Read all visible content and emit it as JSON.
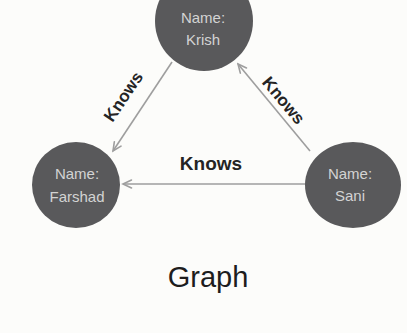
{
  "diagram": {
    "title": "Graph",
    "nodes": [
      {
        "id": "krish",
        "label_line1": "Name:",
        "label_line2": "Krish"
      },
      {
        "id": "farshad",
        "label_line1": "Name:",
        "label_line2": "Farshad"
      },
      {
        "id": "sani",
        "label_line1": "Name:",
        "label_line2": "Sani"
      }
    ],
    "edges": [
      {
        "from": "Krish",
        "to": "Farshad",
        "label": "Knows"
      },
      {
        "from": "Sani",
        "to": "Krish",
        "label": "Knows"
      },
      {
        "from": "Sani",
        "to": "Farshad",
        "label": "Knows"
      }
    ],
    "colors": {
      "background": "#fcfcfa",
      "node_fill": "#59595b",
      "node_text": "#d3d3d3",
      "edge": "#9e9e9e",
      "edge_label_text": "#242424",
      "title_text": "#1d1d1d"
    }
  }
}
